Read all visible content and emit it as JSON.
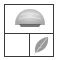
{
  "thumbnail": {
    "panels": [
      {
        "position": "top",
        "content": "dome-shell-image"
      },
      {
        "position": "bottom-left",
        "content": "empty"
      },
      {
        "position": "bottom-right",
        "content": "leaf-image"
      }
    ],
    "colors": {
      "border": "#3a3a3a",
      "background": "#ffffff",
      "shape_fill": "#c8c8c8",
      "shape_dark": "#555555"
    }
  }
}
